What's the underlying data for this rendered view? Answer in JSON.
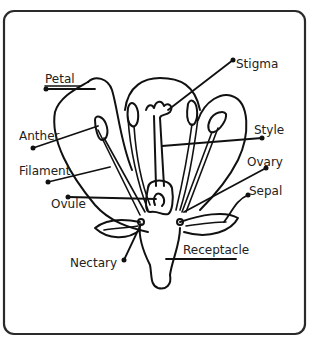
{
  "diagram": {
    "labels": {
      "petal": "Petal",
      "stigma": "Stigma",
      "anther": "Anther",
      "style": "Style",
      "filament": "Filament",
      "ovary": "Ovary",
      "ovule": "Ovule",
      "sepal": "Sepal",
      "nectary": "Nectary",
      "receptacle": "Receptacle"
    },
    "colors": {
      "line": "#111111",
      "frame": "#2a2a2a",
      "background": "#ffffff"
    }
  }
}
